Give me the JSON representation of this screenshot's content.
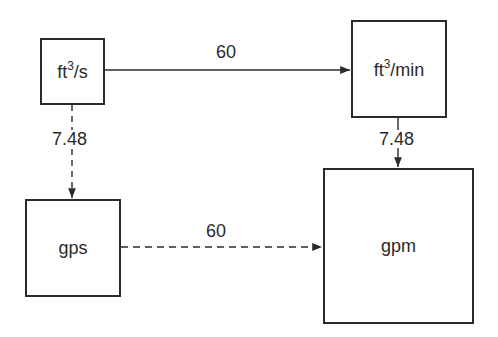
{
  "diagram": {
    "type": "unit-conversion-flow",
    "colors": {
      "stroke": "#2a2a2a",
      "background": "#ffffff"
    },
    "nodes": [
      {
        "id": "ft3_per_s",
        "label_base": "ft",
        "label_sup": "3",
        "label_suffix": "/s",
        "full_label": "ft³/s",
        "box": {
          "x": 40,
          "y": 38,
          "w": 65,
          "h": 67
        }
      },
      {
        "id": "ft3_per_min",
        "label_base": "ft",
        "label_sup": "3",
        "label_suffix": "/min",
        "full_label": "ft³/min",
        "box": {
          "x": 351,
          "y": 20,
          "w": 96,
          "h": 98
        }
      },
      {
        "id": "gps",
        "label_base": "gps",
        "label_sup": "",
        "label_suffix": "",
        "full_label": "gps",
        "box": {
          "x": 25,
          "y": 199,
          "w": 96,
          "h": 98
        }
      },
      {
        "id": "gpm",
        "label_base": "gpm",
        "label_sup": "",
        "label_suffix": "",
        "full_label": "gpm",
        "box": {
          "x": 323,
          "y": 168,
          "w": 151,
          "h": 156
        }
      }
    ],
    "edges": [
      {
        "from": "ft3_per_s",
        "to": "ft3_per_min",
        "label": "60",
        "style": "solid",
        "direction": "right"
      },
      {
        "from": "ft3_per_s",
        "to": "gps",
        "label": "7.48",
        "style": "dashed",
        "direction": "down"
      },
      {
        "from": "ft3_per_min",
        "to": "gpm",
        "label": "7.48",
        "style": "solid",
        "direction": "down"
      },
      {
        "from": "gps",
        "to": "gpm",
        "label": "60",
        "style": "dashed",
        "direction": "right"
      }
    ]
  }
}
